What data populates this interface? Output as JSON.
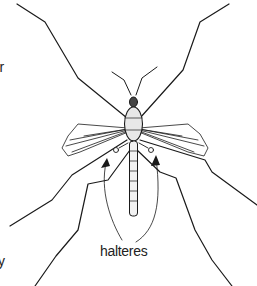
{
  "diagram": {
    "labels": {
      "halteres": "halteres",
      "left_clipped_upper": "er",
      "left_clipped_lower": "y"
    },
    "colors": {
      "ink": "#1a1a1a",
      "background": "#ffffff"
    }
  }
}
